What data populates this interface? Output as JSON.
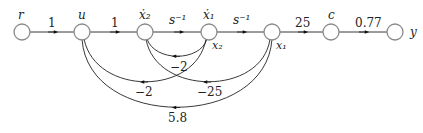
{
  "diagram": {
    "type": "signal-flow-graph",
    "nodes": [
      {
        "id": "r",
        "label": "r",
        "x": 22,
        "y": 32
      },
      {
        "id": "u",
        "label": "u",
        "x": 82,
        "y": 32
      },
      {
        "id": "x2dot",
        "label": "ẋ₂",
        "x": 145,
        "y": 32
      },
      {
        "id": "x1dot",
        "label": "ẋ₁",
        "x": 209,
        "y": 32,
        "sub_label": "x₂"
      },
      {
        "id": "x1",
        "label": "",
        "x": 272,
        "y": 32,
        "sub_label": "x₁"
      },
      {
        "id": "c",
        "label": "c",
        "x": 331,
        "y": 32
      },
      {
        "id": "y",
        "label": "y",
        "x": 395,
        "y": 32
      }
    ],
    "forward_edges": [
      {
        "from": "r",
        "to": "u",
        "gain": "1"
      },
      {
        "from": "u",
        "to": "x2dot",
        "gain": "1"
      },
      {
        "from": "x2dot",
        "to": "x1dot",
        "gain": "s⁻¹"
      },
      {
        "from": "x1dot",
        "to": "x1",
        "gain": "s⁻¹"
      },
      {
        "from": "x1",
        "to": "c",
        "gain": "25"
      },
      {
        "from": "c",
        "to": "y",
        "gain": "0.77"
      }
    ],
    "feedback_edges": [
      {
        "from": "x1dot",
        "to": "x2dot",
        "gain": "−2"
      },
      {
        "from": "x1dot",
        "to": "u",
        "gain": "−2"
      },
      {
        "from": "x1",
        "to": "x2dot",
        "gain": "−25"
      },
      {
        "from": "x1",
        "to": "u",
        "gain": "5.8"
      }
    ]
  }
}
